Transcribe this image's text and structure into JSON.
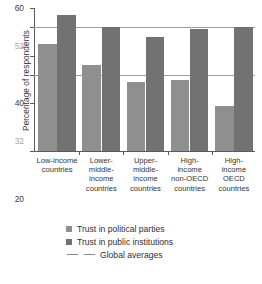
{
  "chart_data": {
    "type": "bar",
    "title": "",
    "xlabel": "",
    "ylabel": "Percentage of respondents",
    "ylim": [
      0,
      60
    ],
    "grid": true,
    "legend_position": "bottom",
    "categories": [
      "Low-income countries",
      "Lower-middle-income countries",
      "Upper-middle-income countries",
      "High-income non-OECD countries",
      "High-income OECD countries"
    ],
    "category_lines": [
      [
        "Low-income",
        "countries"
      ],
      [
        "Lower-",
        "middle-",
        "income",
        "countries"
      ],
      [
        "Upper-",
        "middle-",
        "income",
        "countries"
      ],
      [
        "High-",
        "income",
        "non-OECD",
        "countries"
      ],
      [
        "High-",
        "income",
        "OECD",
        "countries"
      ]
    ],
    "series": [
      {
        "name": "Trust in political parties",
        "color": "#8f8f8f",
        "values": [
          45,
          36,
          29,
          30,
          19
        ]
      },
      {
        "name": "Trust in public institutions",
        "color": "#727272",
        "values": [
          57,
          52,
          48,
          51,
          52
        ]
      }
    ],
    "reference_lines": [
      {
        "label": "Global average - public institutions",
        "value": 52,
        "color": "#9d9d9d"
      },
      {
        "label": "Global average - political parties",
        "value": 32,
        "color": "#9d9d9d"
      }
    ],
    "yticks": [
      {
        "value": 0,
        "label": "0",
        "soft": false
      },
      {
        "value": 20,
        "label": "20",
        "soft": false
      },
      {
        "value": 32,
        "label": "32",
        "soft": true
      },
      {
        "value": 40,
        "label": "40",
        "soft": false
      },
      {
        "value": 52,
        "label": "52",
        "soft": true
      },
      {
        "value": 60,
        "label": "60",
        "soft": false
      }
    ]
  },
  "legend": {
    "items": [
      {
        "label": "Trust in political parties",
        "marker": "swatch-light"
      },
      {
        "label": "Trust in public institutions",
        "marker": "swatch-dark"
      },
      {
        "label": "Global averages",
        "marker": "dashed-lines"
      }
    ]
  },
  "footnote": {
    "text": ""
  }
}
